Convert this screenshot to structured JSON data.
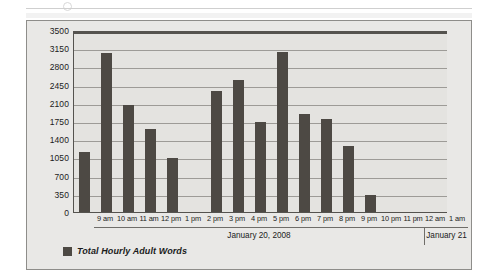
{
  "chart_data": {
    "type": "bar",
    "title": "",
    "subtitle": "",
    "xlabel": "",
    "ylabel": "",
    "ylim": [
      0,
      3500
    ],
    "ytick_step": 350,
    "yticks": [
      0,
      350,
      700,
      1050,
      1400,
      1750,
      2100,
      2450,
      2800,
      3150,
      3500
    ],
    "grid": true,
    "legend_position": "bottom-left",
    "categories": [
      "9 am",
      "10 am",
      "11 am",
      "12 pm",
      "1 pm",
      "2 pm",
      "3 pm",
      "4 pm",
      "5 pm",
      "6 pm",
      "7 pm",
      "8 pm",
      "9 pm",
      "10 pm",
      "11 pm",
      "12 am",
      "1 am"
    ],
    "series": [
      {
        "name": "Total Hourly Adult Words",
        "color": "#4d4944",
        "values": [
          1150,
          3050,
          2050,
          1600,
          1040,
          0,
          2320,
          2540,
          1740,
          3070,
          1880,
          1790,
          1270,
          330,
          0,
          0,
          0
        ]
      }
    ],
    "axis_groups": [
      {
        "label": "January 20, 2008",
        "from": "9 am",
        "to": "11 pm"
      },
      {
        "label": "January 21",
        "from": "12 am",
        "to": "1 am"
      }
    ]
  },
  "legend": {
    "entries": [
      {
        "label": "Total Hourly Adult Words",
        "color": "#4d4944"
      }
    ]
  }
}
